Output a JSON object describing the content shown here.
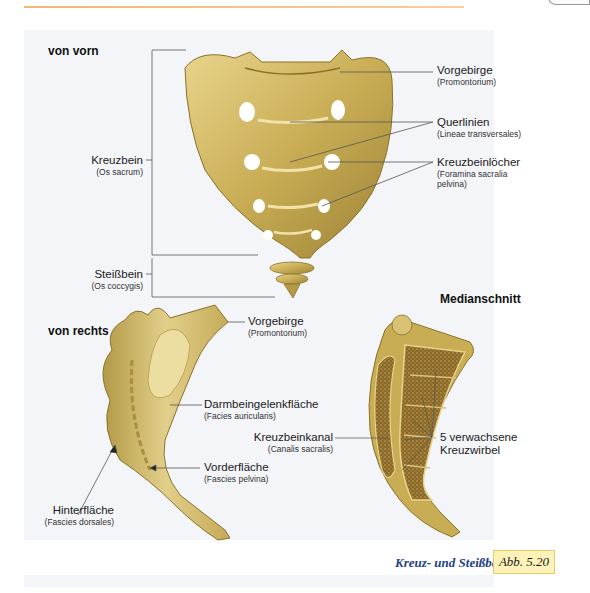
{
  "figure": {
    "caption": "Kreuz- und Steißbein.",
    "figure_number": "Abb. 5.20",
    "colors": {
      "bone": "#c9ad55",
      "bone_light": "#e6d38f",
      "bone_dark": "#8a7228",
      "caption_blue": "#1d3f8a",
      "badge_bg": "#fdf3b8",
      "rule_orange": "#f0b775"
    }
  },
  "views": {
    "front": {
      "title": "von vorn",
      "labels": [
        {
          "main": "Vorgebirge",
          "sub": "(Promontorium)"
        },
        {
          "main": "Querlinien",
          "sub": "(Lineae transversales)"
        },
        {
          "main": "Kreuzbeinlöcher",
          "sub_line1": "(Foramina sacralia",
          "sub_line2": "pelvina)"
        },
        {
          "main": "Kreuzbein",
          "sub": "(Os sacrum)"
        },
        {
          "main": "Steißbein",
          "sub": "(Os coccygis)"
        }
      ]
    },
    "right": {
      "title": "von rechts",
      "labels": [
        {
          "main": "Vorgebirge",
          "sub": "(Promontorium)"
        },
        {
          "main": "Darmbeingelenkfläche",
          "sub": "(Facies auricularis)"
        },
        {
          "main": "Vorderfläche",
          "sub": "(Fascies pelvina)"
        },
        {
          "main": "Hinterfläche",
          "sub": "(Fascies dorsales)"
        }
      ]
    },
    "median": {
      "title": "Medianschnitt",
      "labels": [
        {
          "main": "Kreuzbeinkanal",
          "sub": "(Canalis sacralis)"
        },
        {
          "main_line1": "5 verwachsene",
          "main_line2": "Kreuzwirbel"
        }
      ]
    }
  }
}
